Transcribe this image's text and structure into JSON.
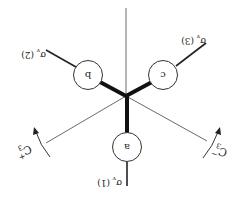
{
  "diagram": {
    "atoms": [
      {
        "id": "a",
        "label": "a"
      },
      {
        "id": "b",
        "label": "b"
      },
      {
        "id": "c",
        "label": "c"
      }
    ],
    "mirror_planes": [
      {
        "label": "σv (1)",
        "sym": "σ",
        "sub": "v",
        "num": "(1)"
      },
      {
        "label": "σv (2)",
        "sym": "σ",
        "sub": "v",
        "num": "(2)"
      },
      {
        "label": "σv (3)",
        "sym": "σ",
        "sub": "v",
        "num": "(3)"
      }
    ],
    "rotations": [
      {
        "label": "C3+",
        "sym": "C",
        "sub": "3",
        "sup": "+"
      },
      {
        "label": "C3-",
        "sym": "C",
        "sub": "3",
        "sup": "−"
      }
    ],
    "colors": {
      "line": "#222222",
      "background": "#ffffff"
    }
  }
}
